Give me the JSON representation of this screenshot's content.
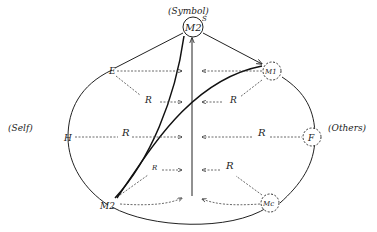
{
  "diagram": {
    "labels": {
      "symbol": "(Symbol)",
      "self": "(Self)",
      "others": "(Others)",
      "s_mark": "S"
    },
    "nodes": {
      "m2_top": "M2",
      "m1": "M1",
      "f": "F",
      "mc": "Mc",
      "m2_bottom": "M2",
      "e": "E",
      "h": "H"
    },
    "relations": {
      "r_upper_left": "R",
      "r_upper_right": "R",
      "r_mid_left": "R",
      "r_mid_right": "R",
      "r_lower_left": "R",
      "r_lower_right": "R"
    }
  }
}
